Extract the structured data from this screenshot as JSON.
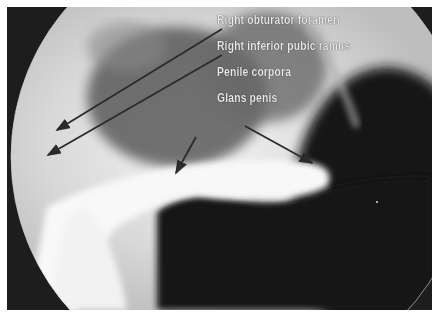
{
  "figure": {
    "type": "radiograph",
    "labels": [
      {
        "text": "Right obturator foramen",
        "x": 217,
        "y": 7
      },
      {
        "text": "Right inferior pubic ramus",
        "x": 217,
        "y": 33
      },
      {
        "text": "Penile corpora",
        "x": 217,
        "y": 59
      },
      {
        "text": "Glans penis",
        "x": 217,
        "y": 85
      }
    ],
    "arrows": [
      {
        "label_index": 0,
        "from": [
          222,
          22
        ],
        "to": [
          57,
          130
        ]
      },
      {
        "label_index": 1,
        "from": [
          222,
          48
        ],
        "to": [
          48,
          155
        ]
      },
      {
        "label_index": 2,
        "from": [
          196,
          136
        ],
        "to": [
          176,
          173
        ]
      },
      {
        "label_index": 3,
        "from": [
          245,
          126
        ],
        "to": [
          312,
          163
        ]
      }
    ]
  }
}
